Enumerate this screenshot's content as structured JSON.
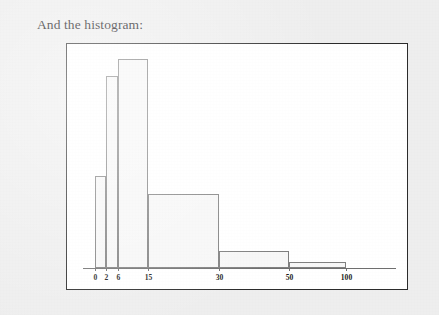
{
  "page": {
    "caption": "And the histogram:",
    "background_color": "#eeeeee"
  },
  "figure": {
    "frame_color": "#2b2b2b",
    "plot_background": "#ffffff",
    "bar_fill": "#f7f7f7",
    "bar_stroke": "#808080",
    "axis_color": "#6e6e6e"
  },
  "chart_data": {
    "type": "bar",
    "title": "",
    "subtitle": "",
    "xlabel": "",
    "ylabel": "",
    "grid": false,
    "legend": "none",
    "orientation": "vertical",
    "note": "Histogram with unequal (variable-width) bins plotted on a non-linear category axis; bar heights are densities.",
    "bin_edges": [
      0,
      2,
      6,
      15,
      30,
      50,
      100
    ],
    "tick_labels": [
      "0",
      "2",
      "6",
      "15",
      "30",
      "50",
      "100"
    ],
    "tick_positions_px": [
      28,
      39,
      51,
      81,
      152,
      222,
      279
    ],
    "categories": [
      "0-2",
      "2-6",
      "6-15",
      "15-30",
      "30-50",
      "50-100"
    ],
    "values": [
      42.5,
      88.5,
      96.0,
      33.5,
      8.0,
      3.0
    ],
    "bar_tops_px": [
      175,
      75,
      58,
      193,
      250,
      261
    ],
    "baseline_px": 267,
    "xlim": [
      0,
      100
    ],
    "ylim": [
      0,
      100
    ]
  }
}
